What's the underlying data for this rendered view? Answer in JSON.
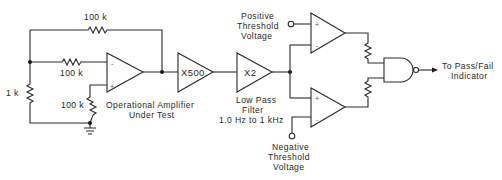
{
  "diagram": {
    "type": "circuit-schematic",
    "stroke_color": "#2a2a2a",
    "background": "#ffffff",
    "resistors": {
      "feedback_top": "100 k",
      "input": "100 k",
      "noninv_to_ground": "100 k",
      "shunt": "1 k"
    },
    "op_amp_under_test": {
      "label_line1": "Operational Amplifier",
      "label_line2": "Under Test",
      "inv_sign": "-",
      "noninv_sign": "+"
    },
    "gain_stage": {
      "label": "X500"
    },
    "filter_stage": {
      "label": "X2",
      "caption_line1": "Low Pass",
      "caption_line2": "Filter",
      "caption_line3": "1.0 Hz to 1 kHz"
    },
    "upper_comparator": {
      "plus": "+",
      "minus": "-",
      "threshold_line1": "Positive",
      "threshold_line2": "Threshold",
      "threshold_line3": "Voltage"
    },
    "lower_comparator": {
      "plus": "+",
      "minus": "-",
      "threshold_line1": "Negative",
      "threshold_line2": "Threshold",
      "threshold_line3": "Voltage"
    },
    "output": {
      "gate": "NAND",
      "label_line1": "To Pass/Fail",
      "label_line2": "Indicator"
    }
  }
}
